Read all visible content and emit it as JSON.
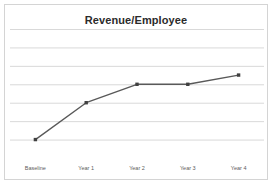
{
  "chart_data": {
    "type": "line",
    "title": "Revenue/Employee",
    "xlabel": "",
    "ylabel": "",
    "categories": [
      "Baseline",
      "Year 1",
      "Year 2",
      "Year 3",
      "Year 4"
    ],
    "series": [
      {
        "name": "Revenue/Employee",
        "values": [
          1,
          3,
          4,
          4,
          4.5
        ]
      }
    ],
    "ylim": [
      0,
      7
    ],
    "yticks": [
      0,
      1,
      2,
      3,
      4,
      5,
      6,
      7
    ],
    "grid": true,
    "grid_horizontal": true,
    "grid_vertical": false,
    "y_tick_labels_visible": false,
    "legend": false,
    "legend_position": "none",
    "markers": "square",
    "line_color": "#595959",
    "marker_color": "#404040",
    "grid_color": "#d9d9d9",
    "axis_color": "#d9d9d9",
    "plot_background": "#ffffff",
    "points": [
      {
        "category": "Baseline",
        "value": 1
      },
      {
        "category": "Year 1",
        "value": 3
      },
      {
        "category": "Year 2",
        "value": 4
      },
      {
        "category": "Year 3",
        "value": 4
      },
      {
        "category": "Year 4",
        "value": 4.5
      }
    ]
  },
  "card": {
    "border_color": "#d4d4d4",
    "background": "#ffffff"
  },
  "title": {
    "text": "Revenue/Employee",
    "color": "#2b2b2b"
  }
}
